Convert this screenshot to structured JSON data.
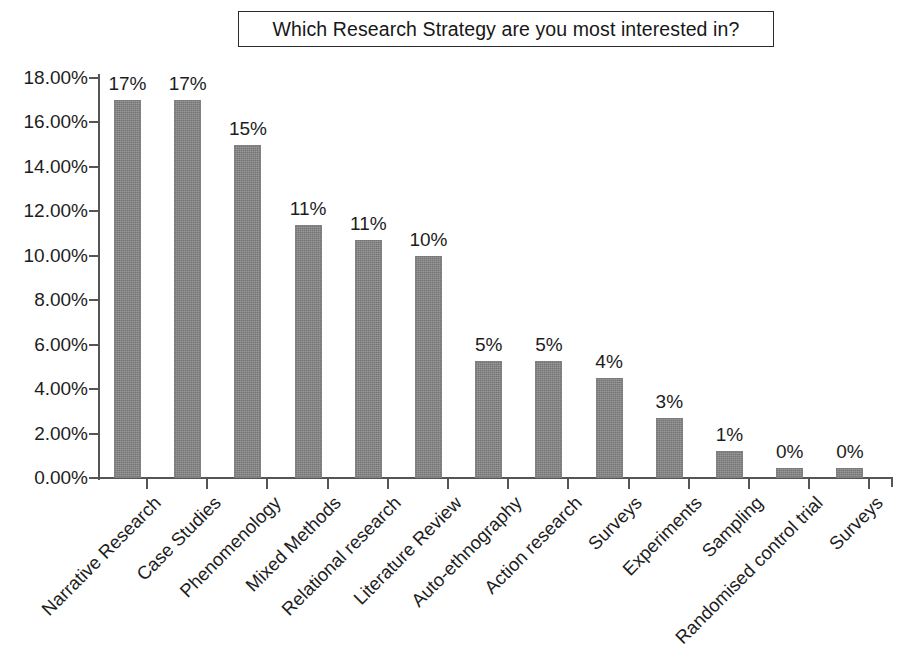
{
  "title": {
    "text": "Which Research Strategy are you most interested in?"
  },
  "axis": {
    "y_ticks": [
      "0.00%",
      "2.00%",
      "4.00%",
      "6.00%",
      "8.00%",
      "10.00%",
      "12.00%",
      "14.00%",
      "16.00%",
      "18.00%"
    ]
  },
  "colors": {
    "bar_fill": "#838383",
    "axis": "#555555",
    "text": "#1d1d1d",
    "title_border": "#2b2b2b",
    "background": "#ffffff"
  },
  "chart_data": {
    "type": "bar",
    "title": "Which Research Strategy are you most interested in?",
    "xlabel": "",
    "ylabel": "",
    "ylim": [
      0,
      18
    ],
    "ytick_values": [
      0,
      2,
      4,
      6,
      8,
      10,
      12,
      14,
      16,
      18
    ],
    "ytick_labels": [
      "0.00%",
      "2.00%",
      "4.00%",
      "6.00%",
      "8.00%",
      "10.00%",
      "12.00%",
      "14.00%",
      "16.00%",
      "18.00%"
    ],
    "grid": false,
    "legend": false,
    "value_label_format": "percent-rounded",
    "categories": [
      "Narrative Research",
      "Case Studies",
      "Phenomenology",
      "Mixed Methods",
      "Relational research",
      "Literature Review",
      "Auto-ethnography",
      "Action research",
      "Surveys",
      "Experiments",
      "Sampling",
      "Randomised control trial",
      "Surveys"
    ],
    "values": [
      17.0,
      17.0,
      15.0,
      11.4,
      10.7,
      10.0,
      5.25,
      5.25,
      4.5,
      2.7,
      1.2,
      0.45,
      0.45
    ],
    "data_labels": [
      "17%",
      "17%",
      "15%",
      "11%",
      "11%",
      "10%",
      "5%",
      "5%",
      "4%",
      "3%",
      "1%",
      "0%",
      "0%"
    ]
  }
}
